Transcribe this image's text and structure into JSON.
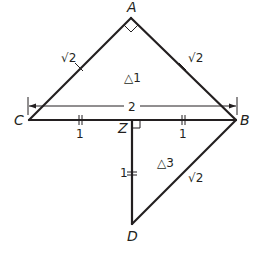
{
  "diagram": {
    "type": "geometry",
    "vertices": {
      "A": {
        "label": "A",
        "x": 131,
        "y": 18
      },
      "B": {
        "label": "B",
        "x": 236,
        "y": 120
      },
      "C": {
        "label": "C",
        "x": 29,
        "y": 120
      },
      "Z": {
        "label": "Z",
        "x": 132,
        "y": 120
      },
      "D": {
        "label": "D",
        "x": 132,
        "y": 224
      }
    },
    "labels": {
      "side_ca": "√2",
      "side_ab": "√2",
      "triangle1": "△1",
      "triangle3": "△3",
      "dimension_cb": "2",
      "seg_cz": "1",
      "seg_zb": "1",
      "seg_zd": "1",
      "side_bd": "√2"
    },
    "right_angles": [
      "A",
      "Z"
    ],
    "stroke_color": "#231f20"
  }
}
